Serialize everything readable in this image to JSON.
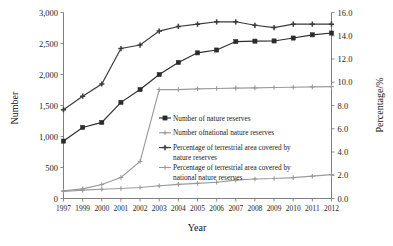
{
  "chart_data": {
    "type": "line",
    "title": "",
    "xlabel": "Year",
    "ylabel": "Number",
    "y2label": "Percentage/%",
    "grid": false,
    "legend_position": "center",
    "categories": [
      "1997",
      "1999",
      "2000",
      "2001",
      "2002",
      "2003",
      "2004",
      "2005",
      "2006",
      "2007",
      "2008",
      "2009",
      "2010",
      "2011",
      "2012"
    ],
    "ylim": [
      0,
      3000
    ],
    "yticks": [
      "0",
      "500",
      "1,000",
      "1,500",
      "2,000",
      "2,500",
      "3,000"
    ],
    "ytick_values": [
      0,
      500,
      1000,
      1500,
      2000,
      2500,
      3000
    ],
    "y2lim": [
      0,
      16
    ],
    "y2ticks": [
      "0.0",
      "2.0",
      "4.0",
      "6.0",
      "8.0",
      "10.0",
      "12.0",
      "14.0",
      "16.0"
    ],
    "y2tick_values": [
      0,
      2,
      4,
      6,
      8,
      10,
      12,
      14,
      16
    ],
    "series": [
      {
        "name": "Number of nature reserves",
        "axis": "left",
        "color": "#2b2b2b",
        "marker": "square",
        "values": [
          926,
          1146,
          1227,
          1551,
          1757,
          1999,
          2194,
          2349,
          2395,
          2531,
          2538,
          2541,
          2588,
          2640,
          2669
        ]
      },
      {
        "name": "Number ofnational nature reserves",
        "axis": "left",
        "color": "#9a9a9a",
        "marker": "cross",
        "values": [
          124,
          155,
          226,
          338,
          596,
          1757,
          1757,
          1769,
          1775,
          1780,
          1785,
          1790,
          1795,
          1800,
          1805
        ]
      },
      {
        "name": "Percentage of terrestrial area covered by nature reserves",
        "axis": "right",
        "color": "#3a3a3a",
        "marker": "plus",
        "values": [
          7.64,
          8.8,
          9.85,
          12.9,
          13.2,
          14.4,
          14.8,
          15.0,
          15.2,
          15.2,
          14.9,
          14.7,
          15.0,
          15.0,
          15.0
        ]
      },
      {
        "name": "Percentage of terrestrial area covered by national nature reserves",
        "axis": "right",
        "color": "#9a9a9a",
        "marker": "cross",
        "values": [
          0.6,
          0.72,
          0.8,
          0.86,
          0.95,
          1.1,
          1.22,
          1.3,
          1.4,
          1.58,
          1.68,
          1.72,
          1.8,
          1.92,
          2.05
        ]
      }
    ],
    "legend": [
      "Number of nature reserves",
      "Number ofnational nature reserves",
      "Percentage of terrestrial area covered by",
      "nature reserves",
      "Percentage of terrestrial area covered by",
      "national nature reserves"
    ]
  }
}
